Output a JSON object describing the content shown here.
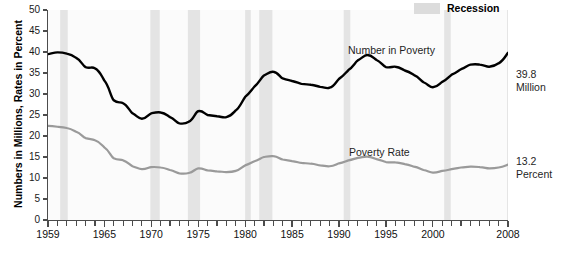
{
  "legend": {
    "position": "top-right",
    "entries": [
      {
        "label": "Recession",
        "swatch_color": "#dcdcdc",
        "icon": "recession-band-swatch"
      }
    ]
  },
  "axes": {
    "ylabel": "Numbers in Millions, Rates in Percent",
    "xlabel": "",
    "ytick_labels": [
      "0",
      "5",
      "10",
      "15",
      "20",
      "25",
      "30",
      "35",
      "40",
      "45",
      "50"
    ],
    "xtick_labels": [
      "1959",
      "1965",
      "1970",
      "1975",
      "1980",
      "1985",
      "1990",
      "1995",
      "2000",
      "2008"
    ]
  },
  "annotations": {
    "number_label": "Number in Poverty",
    "rate_label": "Poverty Rate",
    "number_end_value": "39.8",
    "number_end_unit": "Million",
    "rate_end_value": "13.2",
    "rate_end_unit": "Percent"
  },
  "colors": {
    "number_line": "#000000",
    "rate_line": "#9a9a9a",
    "recession_band": "#e4e4e4",
    "plot_background": "#fbfbfb",
    "axis": "#4c4c4c"
  },
  "chart_data": {
    "type": "line",
    "title": "",
    "subtitle": "",
    "xlabel": "",
    "ylabel": "Numbers in Millions, Rates in Percent",
    "xlim": [
      1959,
      2008
    ],
    "ylim": [
      0,
      50
    ],
    "ytick_step": 5,
    "grid": false,
    "legend_position": "top-right",
    "x": [
      1959,
      1960,
      1961,
      1962,
      1963,
      1964,
      1965,
      1966,
      1967,
      1968,
      1969,
      1970,
      1971,
      1972,
      1973,
      1974,
      1975,
      1976,
      1977,
      1978,
      1979,
      1980,
      1981,
      1982,
      1983,
      1984,
      1985,
      1986,
      1987,
      1988,
      1989,
      1990,
      1991,
      1992,
      1993,
      1994,
      1995,
      1996,
      1997,
      1998,
      1999,
      2000,
      2001,
      2002,
      2003,
      2004,
      2005,
      2006,
      2007,
      2008
    ],
    "series": [
      {
        "name": "Number in Poverty",
        "unit": "millions",
        "color": "#000000",
        "end_label": "39.8 Million",
        "values": [
          39.5,
          39.9,
          39.6,
          38.6,
          36.4,
          36.1,
          33.2,
          28.5,
          27.8,
          25.4,
          24.1,
          25.4,
          25.6,
          24.5,
          23.0,
          23.4,
          25.9,
          25.0,
          24.7,
          24.5,
          26.1,
          29.3,
          31.8,
          34.4,
          35.3,
          33.7,
          33.1,
          32.4,
          32.2,
          31.7,
          31.5,
          33.6,
          35.7,
          38.0,
          39.3,
          38.1,
          36.4,
          36.5,
          35.6,
          34.5,
          32.8,
          31.6,
          32.9,
          34.6,
          35.9,
          37.0,
          37.0,
          36.5,
          37.3,
          39.8
        ]
      },
      {
        "name": "Poverty Rate",
        "unit": "percent",
        "color": "#9a9a9a",
        "end_label": "13.2 Percent",
        "values": [
          22.4,
          22.2,
          21.9,
          21.0,
          19.5,
          19.0,
          17.3,
          14.7,
          14.2,
          12.8,
          12.1,
          12.6,
          12.5,
          11.9,
          11.1,
          11.2,
          12.3,
          11.8,
          11.6,
          11.4,
          11.7,
          13.0,
          14.0,
          15.0,
          15.2,
          14.4,
          14.0,
          13.6,
          13.4,
          13.0,
          12.8,
          13.5,
          14.2,
          14.8,
          15.1,
          14.5,
          13.8,
          13.7,
          13.3,
          12.7,
          11.9,
          11.3,
          11.7,
          12.1,
          12.5,
          12.7,
          12.6,
          12.3,
          12.5,
          13.2
        ]
      }
    ],
    "bands": [
      {
        "name": "recession-1960",
        "start": 1960.3,
        "end": 1961.1
      },
      {
        "name": "recession-1970",
        "start": 1969.9,
        "end": 1970.9
      },
      {
        "name": "recession-1974",
        "start": 1973.9,
        "end": 1975.2
      },
      {
        "name": "recession-1980",
        "start": 1980.0,
        "end": 1980.6
      },
      {
        "name": "recession-1982",
        "start": 1981.5,
        "end": 1982.9
      },
      {
        "name": "recession-1990",
        "start": 1990.5,
        "end": 1991.2
      },
      {
        "name": "recession-2001",
        "start": 2001.2,
        "end": 2001.9
      },
      {
        "name": "recession-2008",
        "start": 2007.9,
        "end": 2008.6
      }
    ]
  }
}
